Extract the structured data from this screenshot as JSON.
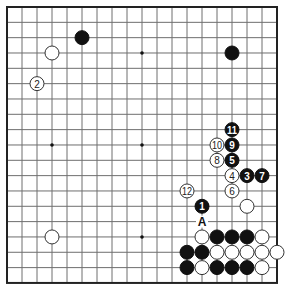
{
  "board": {
    "size": 19,
    "origin_x": 7,
    "origin_y": 7,
    "spacing_x": 15.0,
    "spacing_y": 15.33,
    "stone_radius": 7,
    "colors": {
      "black": "#111111",
      "white": "#ffffff",
      "grid": "#6e6e6e",
      "border": "#222222"
    },
    "star_points": [
      {
        "col": 3,
        "row": 3
      },
      {
        "col": 9,
        "row": 3
      },
      {
        "col": 15,
        "row": 3
      },
      {
        "col": 3,
        "row": 9
      },
      {
        "col": 9,
        "row": 9
      },
      {
        "col": 15,
        "row": 9
      },
      {
        "col": 3,
        "row": 15
      },
      {
        "col": 9,
        "row": 15
      },
      {
        "col": 15,
        "row": 15
      }
    ],
    "stones": [
      {
        "col": 5,
        "row": 2,
        "color": "black",
        "label": ""
      },
      {
        "col": 15,
        "row": 3,
        "color": "black",
        "label": ""
      },
      {
        "col": 3,
        "row": 3,
        "color": "white",
        "label": ""
      },
      {
        "col": 2,
        "row": 5,
        "color": "white",
        "label": "2"
      },
      {
        "col": 3,
        "row": 15,
        "color": "white",
        "label": ""
      },
      {
        "col": 13,
        "row": 13,
        "color": "black",
        "label": "1"
      },
      {
        "col": 16,
        "row": 11,
        "color": "black",
        "label": "3"
      },
      {
        "col": 15,
        "row": 11,
        "color": "white",
        "label": "4"
      },
      {
        "col": 15,
        "row": 10,
        "color": "black",
        "label": "5"
      },
      {
        "col": 15,
        "row": 12,
        "color": "white",
        "label": "6"
      },
      {
        "col": 17,
        "row": 11,
        "color": "black",
        "label": "7"
      },
      {
        "col": 14,
        "row": 10,
        "color": "white",
        "label": "8"
      },
      {
        "col": 15,
        "row": 9,
        "color": "black",
        "label": "9"
      },
      {
        "col": 14,
        "row": 9,
        "color": "white",
        "label": "10"
      },
      {
        "col": 15,
        "row": 8,
        "color": "black",
        "label": "11"
      },
      {
        "col": 12,
        "row": 12,
        "color": "white",
        "label": "12"
      },
      {
        "col": 16,
        "row": 13,
        "color": "white",
        "label": ""
      },
      {
        "col": 13,
        "row": 15,
        "color": "white",
        "label": ""
      },
      {
        "col": 14,
        "row": 15,
        "color": "black",
        "label": ""
      },
      {
        "col": 15,
        "row": 15,
        "color": "black",
        "label": ""
      },
      {
        "col": 16,
        "row": 15,
        "color": "black",
        "label": ""
      },
      {
        "col": 17,
        "row": 15,
        "color": "white",
        "label": ""
      },
      {
        "col": 12,
        "row": 16,
        "color": "black",
        "label": ""
      },
      {
        "col": 13,
        "row": 16,
        "color": "black",
        "label": ""
      },
      {
        "col": 14,
        "row": 16,
        "color": "white",
        "label": ""
      },
      {
        "col": 15,
        "row": 16,
        "color": "white",
        "label": ""
      },
      {
        "col": 16,
        "row": 16,
        "color": "white",
        "label": ""
      },
      {
        "col": 17,
        "row": 16,
        "color": "white",
        "label": ""
      },
      {
        "col": 18,
        "row": 16,
        "color": "white",
        "label": ""
      },
      {
        "col": 12,
        "row": 17,
        "color": "black",
        "label": ""
      },
      {
        "col": 13,
        "row": 17,
        "color": "white",
        "label": ""
      },
      {
        "col": 14,
        "row": 17,
        "color": "black",
        "label": ""
      },
      {
        "col": 15,
        "row": 17,
        "color": "black",
        "label": ""
      },
      {
        "col": 16,
        "row": 17,
        "color": "black",
        "label": ""
      },
      {
        "col": 17,
        "row": 17,
        "color": "white",
        "label": ""
      }
    ],
    "markers": [
      {
        "col": 13,
        "row": 14,
        "text": "A"
      }
    ]
  }
}
